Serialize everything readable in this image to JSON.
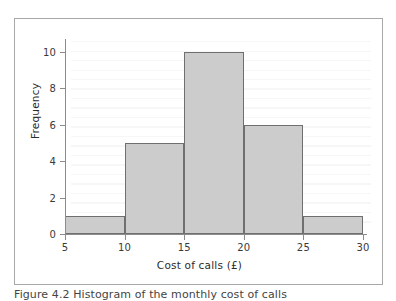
{
  "figure": {
    "caption": "Figure 4.2 Histogram of the monthly cost of calls",
    "frame_color": "#a8a8a8"
  },
  "chart_data": {
    "type": "bar",
    "title": "",
    "xlabel": "Cost of calls (£)",
    "ylabel": "Frequency",
    "categories": [
      "5–10",
      "10–15",
      "15–20",
      "20–25",
      "25–30"
    ],
    "bin_edges": [
      5,
      10,
      15,
      20,
      25,
      30
    ],
    "values": [
      1,
      5,
      10,
      6,
      1
    ],
    "xlim": [
      5,
      30
    ],
    "ylim": [
      0,
      10.7
    ],
    "xticks": [
      5,
      10,
      15,
      20,
      25,
      30
    ],
    "yticks": [
      0,
      2,
      4,
      6,
      8,
      10
    ],
    "xtick_labels": [
      "5",
      "10",
      "15",
      "20",
      "25",
      "30"
    ],
    "ytick_labels": [
      "0",
      "2",
      "4",
      "6",
      "8",
      "10"
    ],
    "grid": false,
    "legend": null,
    "bar_fill_color": "#cccccc",
    "bar_edge_color": "#6f6f6f",
    "axis_color": "#8c8c8c"
  }
}
